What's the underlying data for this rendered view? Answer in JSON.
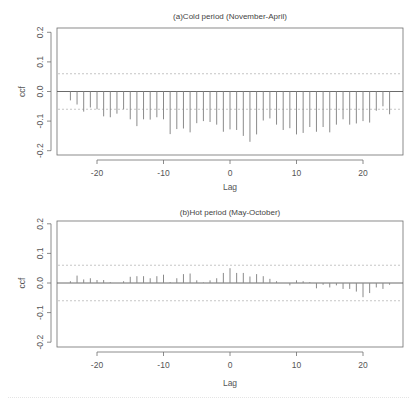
{
  "chart_data": [
    {
      "type": "bar",
      "subtype": "cross-correlation (ccf) stem plot",
      "title": "(a)Cold period (November-April)",
      "xlabel": "Lag",
      "ylabel": "ccf",
      "xlim": [
        -26,
        26
      ],
      "ylim": [
        -0.22,
        0.22
      ],
      "xticks": [
        -20,
        -10,
        0,
        10,
        20
      ],
      "xtick_labels": [
        "-20",
        "-10",
        "0",
        "10",
        "20"
      ],
      "yticks": [
        0.2,
        0.1,
        0.0,
        -0.1,
        -0.2
      ],
      "ytick_labels": [
        "0.2",
        "0.1",
        "0.0",
        "-0.1",
        "-0.2"
      ],
      "confidence_bounds": [
        0.06,
        -0.06
      ],
      "grid": false,
      "legend": null,
      "x": [
        -24,
        -23,
        -22,
        -21,
        -20,
        -19,
        -18,
        -17,
        -16,
        -15,
        -14,
        -13,
        -12,
        -11,
        -10,
        -9,
        -8,
        -7,
        -6,
        -5,
        -4,
        -3,
        -2,
        -1,
        0,
        1,
        2,
        3,
        4,
        5,
        6,
        7,
        8,
        9,
        10,
        11,
        12,
        13,
        14,
        15,
        16,
        17,
        18,
        19,
        20,
        21,
        22,
        23,
        24
      ],
      "values": [
        -0.03,
        -0.044,
        -0.068,
        -0.054,
        -0.06,
        -0.084,
        -0.087,
        -0.075,
        -0.06,
        -0.094,
        -0.117,
        -0.094,
        -0.095,
        -0.087,
        -0.094,
        -0.144,
        -0.127,
        -0.125,
        -0.138,
        -0.107,
        -0.1,
        -0.103,
        -0.112,
        -0.136,
        -0.128,
        -0.13,
        -0.15,
        -0.17,
        -0.145,
        -0.098,
        -0.091,
        -0.112,
        -0.13,
        -0.124,
        -0.145,
        -0.14,
        -0.12,
        -0.136,
        -0.12,
        -0.138,
        -0.112,
        -0.094,
        -0.112,
        -0.108,
        -0.1,
        -0.105,
        -0.065,
        -0.05,
        -0.077
      ]
    },
    {
      "type": "bar",
      "subtype": "cross-correlation (ccf) stem plot",
      "title": "(b)Hot period (May-October)",
      "xlabel": "Lag",
      "ylabel": "ccf",
      "xlim": [
        -26,
        26
      ],
      "ylim": [
        -0.22,
        0.22
      ],
      "xticks": [
        -20,
        -10,
        0,
        10,
        20
      ],
      "xtick_labels": [
        "-20",
        "-10",
        "0",
        "10",
        "20"
      ],
      "yticks": [
        0.2,
        0.1,
        0.0,
        -0.1,
        -0.2
      ],
      "ytick_labels": [
        "0.2",
        "0.1",
        "0.0",
        "-0.1",
        "-0.2"
      ],
      "confidence_bounds": [
        0.06,
        -0.06
      ],
      "grid": false,
      "legend": null,
      "x": [
        -24,
        -23,
        -22,
        -21,
        -20,
        -19,
        -18,
        -17,
        -16,
        -15,
        -14,
        -13,
        -12,
        -11,
        -10,
        -9,
        -8,
        -7,
        -6,
        -5,
        -4,
        -3,
        -2,
        -1,
        0,
        1,
        2,
        3,
        4,
        5,
        6,
        7,
        8,
        9,
        10,
        11,
        12,
        13,
        14,
        15,
        16,
        17,
        18,
        19,
        20,
        21,
        22,
        23,
        24
      ],
      "values": [
        0.006,
        0.025,
        0.012,
        0.016,
        0.01,
        0.01,
        0.003,
        0.0,
        0.006,
        0.021,
        0.023,
        0.023,
        0.016,
        0.023,
        0.028,
        0.003,
        0.016,
        0.03,
        0.032,
        0.009,
        0.002,
        0.009,
        0.016,
        0.034,
        0.05,
        0.034,
        0.034,
        0.022,
        0.03,
        0.023,
        0.014,
        0.006,
        0.0,
        -0.008,
        0.009,
        0.006,
        0.003,
        -0.018,
        -0.006,
        -0.015,
        -0.008,
        -0.02,
        -0.02,
        -0.029,
        -0.048,
        -0.034,
        -0.015,
        -0.02,
        -0.006
      ]
    }
  ],
  "panels": [
    {
      "title": "(a)Cold period (November-April)",
      "xlabel": "Lag",
      "ylabel": "ccf"
    },
    {
      "title": "(b)Hot period (May-October)",
      "xlabel": "Lag",
      "ylabel": "ccf"
    }
  ],
  "colors": {
    "stem": "#8a8a8a",
    "frame": "#6e6e6e",
    "zero_line": "#5a5a5a",
    "confidence": "#b8b8b8",
    "text": "#555555"
  }
}
